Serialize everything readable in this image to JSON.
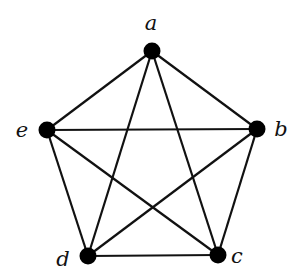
{
  "diagram": {
    "type": "complete-graph",
    "name": "K5",
    "nodes": [
      {
        "id": "a",
        "label": "a",
        "x": 152,
        "y": 51,
        "lx": 151,
        "ly": 30
      },
      {
        "id": "b",
        "label": "b",
        "x": 257,
        "y": 129,
        "lx": 281,
        "ly": 136
      },
      {
        "id": "c",
        "label": "c",
        "x": 218,
        "y": 255,
        "lx": 237,
        "ly": 263
      },
      {
        "id": "d",
        "label": "d",
        "x": 88,
        "y": 256,
        "lx": 63,
        "ly": 266
      },
      {
        "id": "e",
        "label": "e",
        "x": 47,
        "y": 130,
        "lx": 22,
        "ly": 137
      }
    ],
    "edges": [
      [
        "a",
        "b"
      ],
      [
        "a",
        "c"
      ],
      [
        "a",
        "d"
      ],
      [
        "a",
        "e"
      ],
      [
        "b",
        "c"
      ],
      [
        "b",
        "d"
      ],
      [
        "b",
        "e"
      ],
      [
        "c",
        "d"
      ],
      [
        "c",
        "e"
      ],
      [
        "d",
        "e"
      ]
    ],
    "node_color": "#000000",
    "edge_color": "#111111"
  }
}
